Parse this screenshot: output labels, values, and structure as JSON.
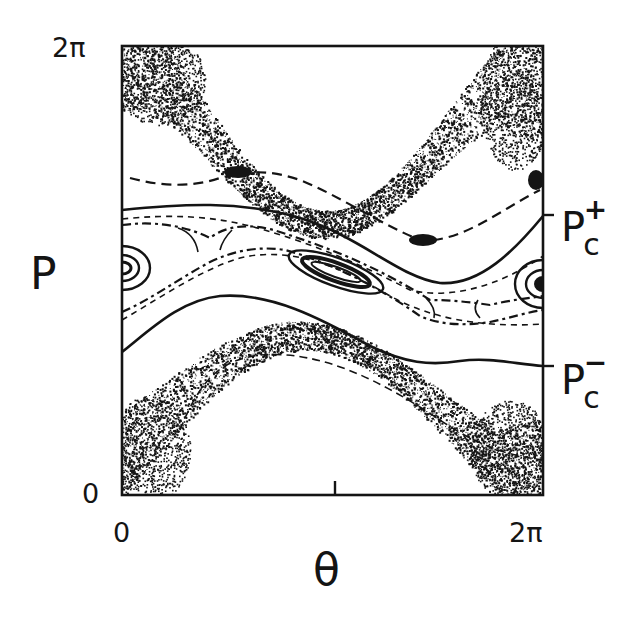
{
  "chart_data": {
    "type": "scatter",
    "subtype": "poincare-section",
    "title": "",
    "xlabel": "θ",
    "ylabel": "P",
    "xlim": [
      0,
      "2π"
    ],
    "ylim": [
      0,
      "2π"
    ],
    "x_ticks": [
      {
        "value": 0,
        "label": "0"
      },
      {
        "value": "π",
        "label": ""
      },
      {
        "value": "2π",
        "label": "2π"
      }
    ],
    "y_ticks": [
      {
        "value": 0,
        "label": "0"
      },
      {
        "value": "2π",
        "label": "2π"
      }
    ],
    "grid": false,
    "legend": null,
    "annotations": [
      {
        "label": "P_c^+",
        "text": "P",
        "sub": "c",
        "sup": "+",
        "y_fraction": 0.625,
        "side": "right"
      },
      {
        "label": "P_c^-",
        "text": "P",
        "sub": "c",
        "sup": "−",
        "y_fraction": 0.288,
        "side": "right"
      }
    ],
    "features": {
      "chaotic_bands": [
        {
          "name": "upper-chaotic-sea",
          "description": "stochastic band near top, dipping to minimum near θ≈1.4π"
        },
        {
          "name": "lower-chaotic-sea",
          "description": "stochastic band near bottom, peaking near θ≈0.6π"
        }
      ],
      "kam_curves": [
        {
          "name": "upper-KAM",
          "description": "solid invariant curve near P_c+"
        },
        {
          "name": "lower-KAM",
          "description": "solid invariant curve near P_c−"
        }
      ],
      "islands": [
        {
          "name": "central-island",
          "theta_approx": "0.9π",
          "p_fraction_approx": 0.52
        },
        {
          "name": "edge-island",
          "theta_approx": "0 / 2π",
          "p_fraction_approx": 0.52
        }
      ]
    }
  },
  "axes": {
    "x_min_label": "0",
    "x_max_label": "2π",
    "y_min_label": "0",
    "y_max_label": "2π",
    "x_title": "θ",
    "y_title": "P"
  },
  "annotations": {
    "pc_plus": {
      "base": "P",
      "sub": "c",
      "sup": "+"
    },
    "pc_minus": {
      "base": "P",
      "sub": "c",
      "sup": "−"
    }
  },
  "colors": {
    "ink": "#141414",
    "paper": "#ffffff"
  }
}
